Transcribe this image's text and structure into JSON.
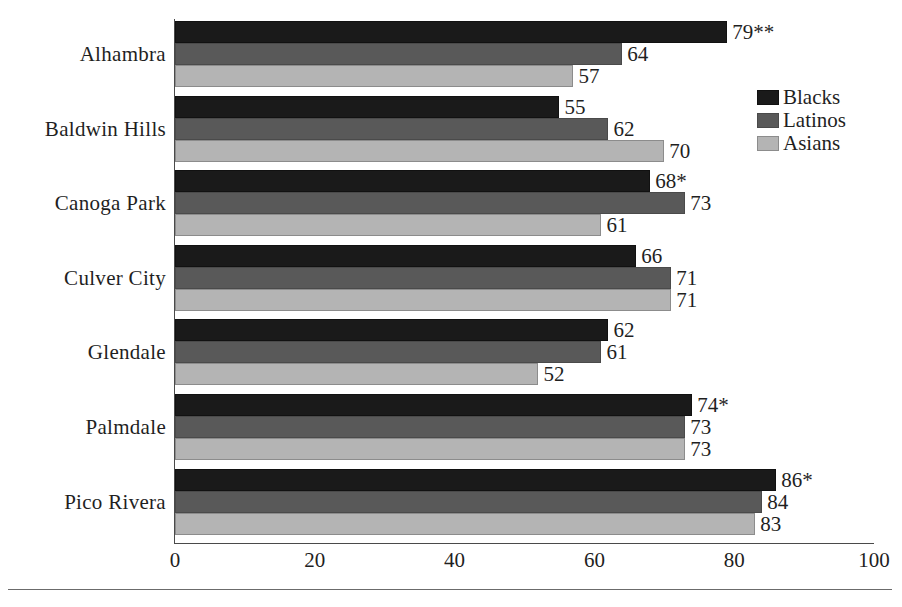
{
  "chart_data": {
    "type": "bar",
    "orientation": "horizontal",
    "title": "",
    "subtitle": "",
    "xlabel": "",
    "ylabel": "",
    "xlim": [
      0,
      100
    ],
    "xticks": [
      0,
      20,
      40,
      60,
      80,
      100
    ],
    "xtick_labels": [
      "0",
      "20",
      "40",
      "60",
      "80",
      "100"
    ],
    "grid": false,
    "legend_position": "right",
    "categories": [
      "Alhambra",
      "Baldwin Hills",
      "Canoga Park",
      "Culver City",
      "Glendale",
      "Palmdale",
      "Pico Rivera"
    ],
    "series": [
      {
        "name": "Blacks",
        "color": "#1a1a1a",
        "values": [
          79,
          55,
          68,
          66,
          62,
          74,
          86
        ],
        "labels": [
          "79**",
          "55",
          "68*",
          "66",
          "62",
          "74*",
          "86*"
        ]
      },
      {
        "name": "Latinos",
        "color": "#595959",
        "values": [
          64,
          62,
          73,
          71,
          61,
          73,
          84
        ],
        "labels": [
          "64",
          "62",
          "73",
          "71",
          "61",
          "73",
          "84"
        ]
      },
      {
        "name": "Asians",
        "color": "#b4b4b4",
        "values": [
          57,
          70,
          61,
          71,
          52,
          73,
          83
        ],
        "labels": [
          "57",
          "70",
          "61",
          "71",
          "52",
          "73",
          "83"
        ]
      }
    ],
    "annotations": [
      "*",
      "**"
    ]
  },
  "legend": {
    "items": [
      {
        "label": "Blacks",
        "swatch": "blacks"
      },
      {
        "label": "Latinos",
        "swatch": "latinos"
      },
      {
        "label": "Asians",
        "swatch": "asians"
      }
    ]
  }
}
